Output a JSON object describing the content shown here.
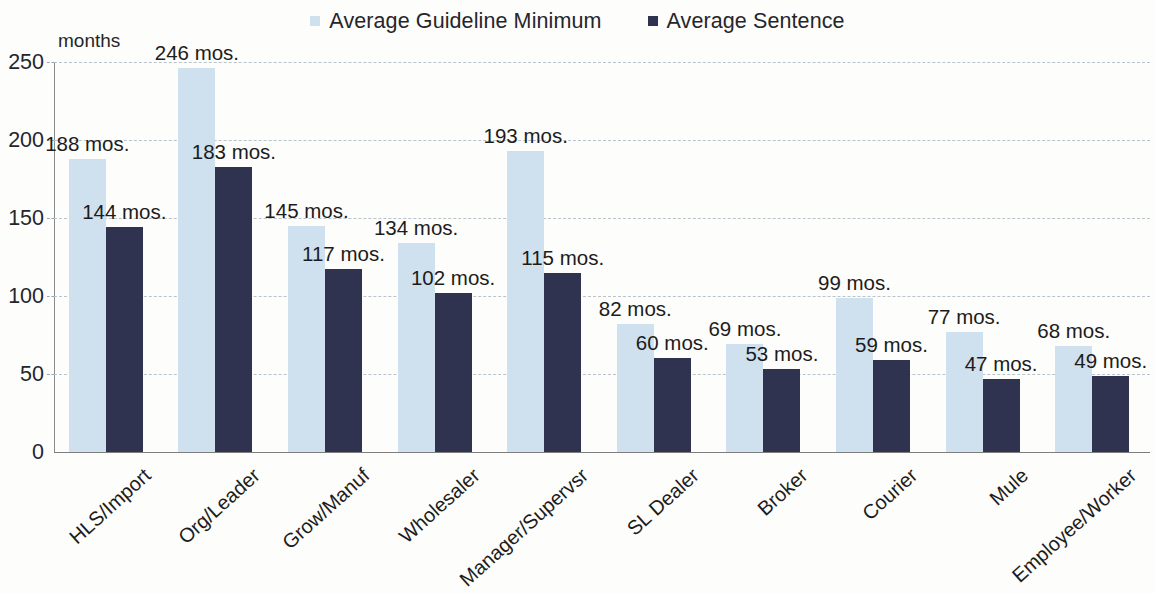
{
  "legend": {
    "entries": [
      {
        "label": "Average Guideline Minimum",
        "color": "#cfe1ee",
        "marker": "square-marker"
      },
      {
        "label": "Average Sentence",
        "color": "#2f3350",
        "marker": "square-marker"
      }
    ]
  },
  "axis": {
    "unit_label": "months",
    "yticks": [
      "0",
      "50",
      "100",
      "150",
      "200",
      "250"
    ]
  },
  "chart_data": {
    "type": "bar",
    "title": "",
    "subtitle": "",
    "xlabel": "",
    "ylabel": "months",
    "ylim": [
      0,
      250
    ],
    "yticks": [
      0,
      50,
      100,
      150,
      200,
      250
    ],
    "grid": true,
    "legend_position": "top-center",
    "value_suffix": " mos.",
    "categories": [
      "HLS/Import",
      "Org/Leader",
      "Grow/Manuf",
      "Wholesaler",
      "Manager/Supervsr",
      "SL Dealer",
      "Broker",
      "Courier",
      "Mule",
      "Employee/Worker"
    ],
    "series": [
      {
        "name": "Average Guideline Minimum",
        "color": "#cfe1ee",
        "values": [
          188,
          246,
          145,
          134,
          193,
          82,
          69,
          99,
          77,
          68
        ],
        "labels": [
          "188 mos.",
          "246 mos.",
          "145 mos.",
          "134 mos.",
          "193 mos.",
          "82 mos.",
          "69 mos.",
          "99 mos.",
          "77 mos.",
          "68 mos."
        ]
      },
      {
        "name": "Average Sentence",
        "color": "#2f3350",
        "values": [
          144,
          183,
          117,
          102,
          115,
          60,
          53,
          59,
          47,
          49
        ],
        "labels": [
          "144 mos.",
          "183 mos.",
          "117 mos.",
          "102 mos.",
          "115 mos.",
          "60 mos.",
          "53 mos.",
          "59 mos.",
          "47 mos.",
          "49 mos."
        ]
      }
    ]
  }
}
